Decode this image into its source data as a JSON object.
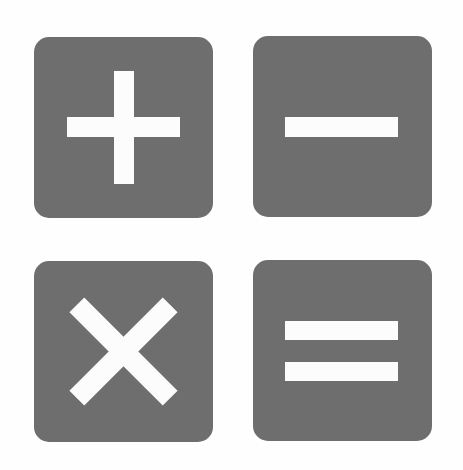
{
  "colors": {
    "background": "#fefefe",
    "tile": "#6e6e6e",
    "glyph": "#fcfcfc"
  },
  "tiles": [
    {
      "id": "plus",
      "icon": "plus-icon",
      "label": "Add",
      "symbol": "+"
    },
    {
      "id": "minus",
      "icon": "minus-icon",
      "label": "Subtract",
      "symbol": "−"
    },
    {
      "id": "times",
      "icon": "multiply-icon",
      "label": "Multiply",
      "symbol": "×"
    },
    {
      "id": "equal",
      "icon": "equals-icon",
      "label": "Equals",
      "symbol": "="
    }
  ]
}
